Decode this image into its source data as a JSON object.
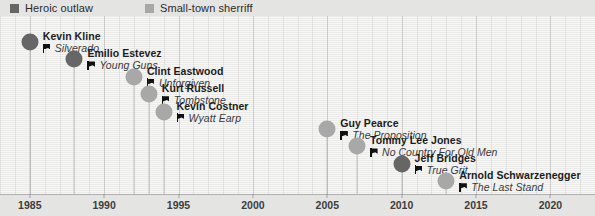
{
  "legend": {
    "items": [
      {
        "label": "Heroic outlaw",
        "color": "#666666",
        "icon": "legend-swatch-outlaw"
      },
      {
        "label": "Small-town sherriff",
        "color": "#a8a8a8",
        "icon": "legend-swatch-sherriff"
      }
    ]
  },
  "axis": {
    "ticks": [
      1985,
      1990,
      1995,
      2000,
      2005,
      2010,
      2015,
      2020
    ],
    "minor_step": 1,
    "range": [
      1983,
      2023
    ]
  },
  "chart_data": {
    "type": "scatter",
    "title": "",
    "xlabel": "",
    "ylabel": "",
    "xlim": [
      1983,
      2023
    ],
    "grid": true,
    "legend_position": "top-left",
    "series": [
      {
        "name": "Heroic outlaw",
        "color": "#666666"
      },
      {
        "name": "Small-town sherriff",
        "color": "#a8a8a8"
      }
    ],
    "points": [
      {
        "actor": "Kevin Kline",
        "film": "Silverado",
        "year": 1985,
        "category": "Heroic outlaw",
        "color": "#666666"
      },
      {
        "actor": "Emilio Estevez",
        "film": "Young Guns",
        "year": 1988,
        "category": "Heroic outlaw",
        "color": "#666666"
      },
      {
        "actor": "Clint Eastwood",
        "film": "Unforgiven",
        "year": 1992,
        "category": "Small-town sherriff",
        "color": "#a8a8a8"
      },
      {
        "actor": "Kurt Russell",
        "film": "Tombstone",
        "year": 1993,
        "category": "Small-town sherriff",
        "color": "#a8a8a8"
      },
      {
        "actor": "Kevin Costner",
        "film": "Wyatt Earp",
        "year": 1994,
        "category": "Small-town sherriff",
        "color": "#a8a8a8"
      },
      {
        "actor": "Guy Pearce",
        "film": "The Proposition",
        "year": 2005,
        "category": "Small-town sherriff",
        "color": "#a8a8a8"
      },
      {
        "actor": "Tommy Lee Jones",
        "film": "No Country For Old Men",
        "year": 2007,
        "category": "Small-town sherriff",
        "color": "#a8a8a8"
      },
      {
        "actor": "Jeff Bridges",
        "film": "True Grit",
        "year": 2010,
        "category": "Heroic outlaw",
        "color": "#666666"
      },
      {
        "actor": "Arnold Schwarzenegger",
        "film": "The Last Stand",
        "year": 2013,
        "category": "Small-town sherriff",
        "color": "#a8a8a8"
      }
    ]
  }
}
